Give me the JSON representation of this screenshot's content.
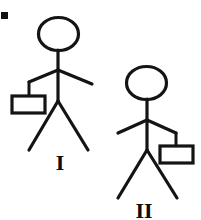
{
  "canvas": {
    "width": 201,
    "height": 220,
    "background_color": "#ffffff",
    "stroke_color": "#141414",
    "label_color": "#0d0d0d"
  },
  "corner_mark": {
    "shape": "small-filled-square",
    "x": 1,
    "y": 12,
    "width": 7,
    "height": 7,
    "color": "#111111"
  },
  "figures": [
    {
      "id": "figure-1",
      "label": "I",
      "label_x": 60,
      "label_y": 170,
      "label_font_size": 22,
      "bag_side": "left",
      "description": "Stick figure standing upright carrying a rectangular bag hanging from the left arm",
      "head": {
        "cx": 58.5,
        "cy": 34,
        "rx": 20,
        "ry": 16.5
      },
      "torso": {
        "x1": 58,
        "y1": 50,
        "x2": 58,
        "y2": 101
      },
      "arm_left": {
        "x1": 58,
        "y1": 70,
        "x2": 29,
        "y2": 82
      },
      "arm_right": {
        "x1": 58,
        "y1": 70,
        "x2": 92,
        "y2": 84
      },
      "strap": {
        "x1": 29,
        "y1": 82,
        "x2": 29,
        "y2": 96
      },
      "bag": {
        "x": 12,
        "y": 96,
        "width": 33,
        "height": 17
      },
      "leg_left": {
        "x1": 58,
        "y1": 101,
        "x2": 29,
        "y2": 150
      },
      "leg_right": {
        "x1": 58,
        "y1": 101,
        "x2": 88,
        "y2": 150
      }
    },
    {
      "id": "figure-2",
      "label": "II",
      "label_x": 144,
      "label_y": 218,
      "label_font_size": 22,
      "bag_side": "right",
      "description": "Stick figure standing upright carrying a rectangular bag hanging from the right arm",
      "head": {
        "cx": 146.5,
        "cy": 83,
        "rx": 20,
        "ry": 16.5
      },
      "torso": {
        "x1": 147,
        "y1": 99,
        "x2": 147,
        "y2": 150
      },
      "arm_left": {
        "x1": 147,
        "y1": 120,
        "x2": 118,
        "y2": 133
      },
      "arm_right": {
        "x1": 147,
        "y1": 120,
        "x2": 176,
        "y2": 133
      },
      "strap": {
        "x1": 176,
        "y1": 133,
        "x2": 176,
        "y2": 146
      },
      "bag": {
        "x": 160,
        "y": 146,
        "width": 33,
        "height": 17
      },
      "leg_left": {
        "x1": 147,
        "y1": 150,
        "x2": 118,
        "y2": 198
      },
      "leg_right": {
        "x1": 147,
        "y1": 150,
        "x2": 177,
        "y2": 198
      }
    }
  ],
  "strokes": {
    "head_width": 3.2,
    "limb_width": 3.2,
    "bag_width": 3.2,
    "strap_width": 3.0
  }
}
